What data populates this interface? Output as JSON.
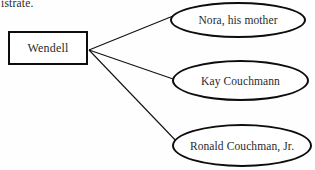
{
  "page": {
    "clipped_text_above": "istrate."
  },
  "diagram": {
    "source_node": {
      "label": "Wendell",
      "shape": "rectangle"
    },
    "target_nodes": [
      {
        "label": "Nora, his mother",
        "shape": "ellipse"
      },
      {
        "label": "Kay Couchmann",
        "shape": "ellipse"
      },
      {
        "label": "Ronald Couchman, Jr.",
        "shape": "ellipse"
      }
    ],
    "colors": {
      "stroke": "#0d0d0d",
      "text": "#2a2a2a",
      "background": "#fefefe"
    }
  }
}
